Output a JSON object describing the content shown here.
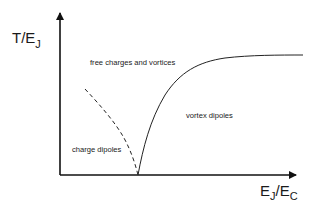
{
  "diagram": {
    "type": "phase-diagram",
    "colors": {
      "background": "#ffffff",
      "axes": "#111111",
      "curve": "#222222",
      "text": "#1a1a1a"
    },
    "y_axis": {
      "label_main": "T/E",
      "label_sub": "J"
    },
    "x_axis": {
      "label_main_1": "E",
      "label_sub_1": "J",
      "label_slash": "/E",
      "label_sub_2": "C"
    },
    "regions": [
      {
        "id": "free",
        "label": "free charges and vortices"
      },
      {
        "id": "vortex",
        "label": "vortex dipoles"
      },
      {
        "id": "charge",
        "label": "charge dipoles"
      }
    ],
    "curves": [
      {
        "id": "vortex-boundary",
        "style": "solid",
        "description": "rises steeply from critical point then saturates"
      },
      {
        "id": "charge-boundary",
        "style": "dashed",
        "description": "decreases toward critical point"
      }
    ]
  }
}
